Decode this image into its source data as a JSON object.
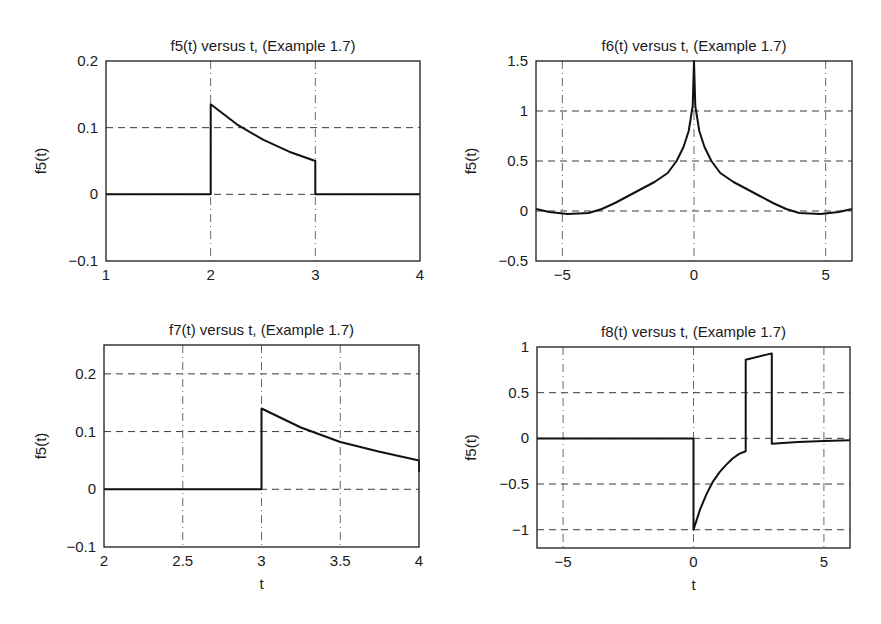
{
  "chart_data": [
    {
      "type": "line",
      "title": "f5(t) versus t, (Example 1.7)",
      "xlabel": "",
      "ylabel": "f5(t)",
      "xlim": [
        1,
        4
      ],
      "ylim": [
        -0.1,
        0.2
      ],
      "xticks": [
        1,
        2,
        3,
        4
      ],
      "xtick_labels": [
        "1",
        "2",
        "3",
        "4"
      ],
      "yticks": [
        -0.1,
        0,
        0.1,
        0.2
      ],
      "ytick_labels": [
        "−0.1",
        "0",
        "0.1",
        "0.2"
      ],
      "grid": true,
      "box": {
        "x": 106,
        "y": 61,
        "w": 314,
        "h": 200
      },
      "x": [
        1,
        2,
        2,
        2.25,
        2.5,
        2.75,
        3,
        3,
        4
      ],
      "y": [
        0,
        0,
        0.135,
        0.105,
        0.082,
        0.064,
        0.05,
        0,
        0
      ]
    },
    {
      "type": "line",
      "title": "f6(t) versus t, (Example 1.7)",
      "xlabel": "",
      "ylabel": "f5(t)",
      "xlim": [
        -6,
        6
      ],
      "ylim": [
        -0.5,
        1.5
      ],
      "xticks": [
        -5,
        0,
        5
      ],
      "xtick_labels": [
        "−5",
        "0",
        "5"
      ],
      "yticks": [
        -0.5,
        0,
        0.5,
        1,
        1.5
      ],
      "ytick_labels": [
        "−0.5",
        "0",
        "0.5",
        "1",
        "1.5"
      ],
      "grid": true,
      "box": {
        "x": 536,
        "y": 61,
        "w": 316,
        "h": 200
      },
      "x": [
        -6,
        -5.5,
        -4.8,
        -4,
        -3.5,
        -3,
        -2.5,
        -2,
        -1.5,
        -1,
        -0.66,
        -0.4,
        -0.2,
        -0.05,
        0,
        0.05,
        0.2,
        0.4,
        0.66,
        1,
        1.5,
        2,
        2.5,
        3,
        3.5,
        4,
        4.8,
        5.5,
        6
      ],
      "y": [
        0.02,
        -0.01,
        -0.03,
        -0.02,
        0.02,
        0.08,
        0.15,
        0.22,
        0.29,
        0.38,
        0.5,
        0.64,
        0.8,
        1.05,
        1.5,
        1.05,
        0.8,
        0.64,
        0.5,
        0.38,
        0.29,
        0.22,
        0.15,
        0.08,
        0.02,
        -0.02,
        -0.03,
        -0.01,
        0.02
      ]
    },
    {
      "type": "line",
      "title": "f7(t) versus t, (Example 1.7)",
      "xlabel": "t",
      "ylabel": "f5(t)",
      "xlim": [
        2,
        4
      ],
      "ylim": [
        -0.1,
        0.25
      ],
      "xticks": [
        2,
        2.5,
        3,
        3.5,
        4
      ],
      "xtick_labels": [
        "2",
        "2.5",
        "3",
        "3.5",
        "4"
      ],
      "yticks": [
        -0.1,
        0,
        0.1,
        0.2
      ],
      "ytick_labels": [
        "−0.1",
        "0",
        "0.1",
        "0.2"
      ],
      "grid": true,
      "box": {
        "x": 104,
        "y": 345,
        "w": 315,
        "h": 202
      },
      "x": [
        2,
        3,
        3,
        3.25,
        3.5,
        3.75,
        4,
        4
      ],
      "y": [
        0,
        0,
        0.14,
        0.107,
        0.082,
        0.065,
        0.05,
        0.03
      ]
    },
    {
      "type": "line",
      "title": "f8(t) versus t, (Example 1.7)",
      "xlabel": "t",
      "ylabel": "f5(t)",
      "xlim": [
        -6,
        6
      ],
      "ylim": [
        -1.2,
        1
      ],
      "xticks": [
        -5,
        0,
        5
      ],
      "xtick_labels": [
        "−5",
        "0",
        "5"
      ],
      "yticks": [
        -1,
        -0.5,
        0,
        0.5,
        1
      ],
      "ytick_labels": [
        "−1",
        "−0.5",
        "0",
        "0.5",
        "1"
      ],
      "grid": true,
      "box": {
        "x": 537,
        "y": 347,
        "w": 313,
        "h": 201
      },
      "x": [
        -6,
        0,
        0,
        0.25,
        0.5,
        0.75,
        1,
        1.25,
        1.5,
        1.75,
        2,
        2,
        3,
        3,
        4,
        5,
        6
      ],
      "y": [
        0,
        0,
        -1,
        -0.78,
        -0.61,
        -0.47,
        -0.37,
        -0.29,
        -0.22,
        -0.17,
        -0.14,
        0.86,
        0.93,
        -0.06,
        -0.04,
        -0.03,
        -0.02
      ]
    }
  ]
}
